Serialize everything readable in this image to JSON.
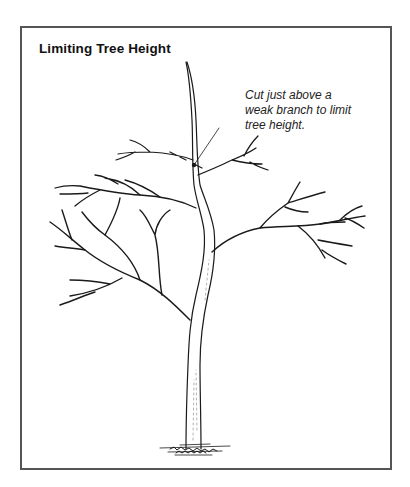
{
  "figure": {
    "title": "Limiting Tree Height",
    "callout": {
      "lines": [
        "Cut just above a",
        "weak branch to limit",
        "tree height."
      ]
    },
    "illustration": "tree-pruning-diagram",
    "colors": {
      "frame": "#555555",
      "ink": "#1a1a1a",
      "background": "#ffffff"
    }
  }
}
